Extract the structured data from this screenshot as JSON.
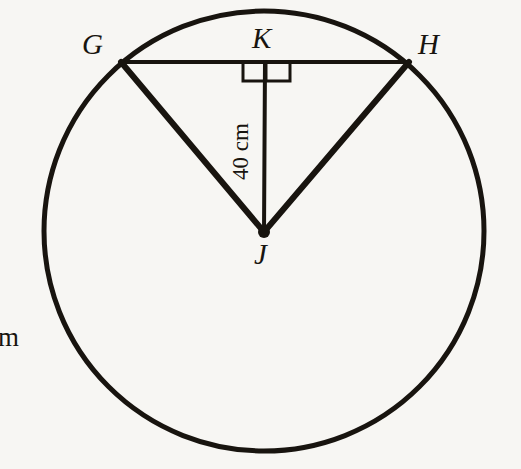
{
  "figure": {
    "kind": "circle-geometry-diagram",
    "width": 521,
    "height": 469,
    "background_color": "#f7f6f3",
    "ink_color": "#18140f"
  },
  "labels": {
    "point_g": "G",
    "point_h": "H",
    "point_k": "K",
    "point_j": "J",
    "segment_kj_length": "40 cm",
    "edge_fragment": "cm"
  },
  "geometry": {
    "circle": {
      "center_x": 264,
      "center_y": 231,
      "radius": 220,
      "stroke_width": 5
    },
    "points": {
      "G": {
        "x": 121,
        "y": 62
      },
      "H": {
        "x": 409,
        "y": 62
      },
      "K": {
        "x": 265,
        "y": 62
      },
      "J": {
        "x": 264,
        "y": 232
      }
    },
    "segments": [
      {
        "name": "chord-gh",
        "x1": 121,
        "y1": 62,
        "x2": 409,
        "y2": 62,
        "stroke_width": 4
      },
      {
        "name": "radius-gj",
        "x1": 121,
        "y1": 62,
        "x2": 264,
        "y2": 232,
        "stroke_width": 6
      },
      {
        "name": "radius-hj",
        "x1": 409,
        "y1": 62,
        "x2": 264,
        "y2": 232,
        "stroke_width": 6
      },
      {
        "name": "perpendicular-kj",
        "x1": 265,
        "y1": 62,
        "x2": 264,
        "y2": 232,
        "stroke_width": 4
      }
    ],
    "center_dot": {
      "x": 264,
      "y": 232,
      "radius": 6
    },
    "right_angle_marker": {
      "left": 243,
      "right": 290,
      "top": 62,
      "bottom": 81,
      "divider_x": 266,
      "stroke_width": 3
    }
  }
}
